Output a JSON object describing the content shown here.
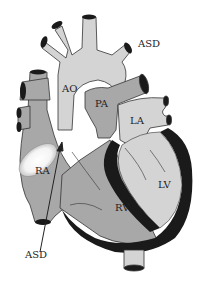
{
  "diagram": {
    "labels": {
      "asd_top": "ASD",
      "ao": "AO",
      "pa": "PA",
      "la": "LA",
      "ra": "RA",
      "lv": "LV",
      "rv": "RV",
      "asd_bottom": "ASD"
    },
    "colors": {
      "light": "#d2d2d2",
      "medium": "#a8a8a8",
      "dark": "#1a1a1a",
      "outline": "#333333"
    }
  }
}
